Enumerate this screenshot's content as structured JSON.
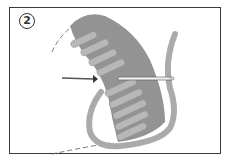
{
  "diagram": {
    "type": "embroidery-stitch-illustration",
    "step_number": "2",
    "elements": {
      "arrow": "arrow-pointing-right",
      "needle": "needle-horizontal",
      "thread": "loose-thread-loop",
      "outline": "dashed-outline"
    },
    "colors": {
      "frame": "#3a3a3a",
      "stitch_dark": "#8c8c8c",
      "stitch_light": "#b4b4b4",
      "thread": "#a8a8a8",
      "needle": "#e8e8e8",
      "background": "#ffffff"
    }
  }
}
